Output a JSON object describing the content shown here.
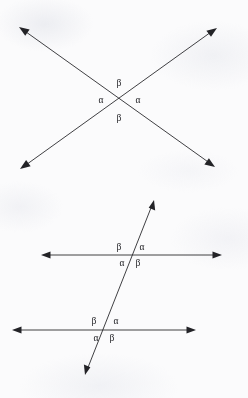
{
  "figure": {
    "title": "Angle relationships at line intersections",
    "background_color": "#fbfbfc",
    "line_color": "#2a2a2e",
    "label_color": "#1d1d21",
    "symbols": {
      "alpha": "α",
      "beta": "β"
    }
  },
  "diagrams": [
    {
      "name": "vertical-angles-x-crossing",
      "description": "Two straight lines crossing at a point forming an X, with vertical angle pairs marked",
      "intersection": {
        "x": 119,
        "y": 100
      },
      "lines": [
        {
          "name": "line-nw-se",
          "x1": 19,
          "y1": 27,
          "x2": 215,
          "y2": 167,
          "arrows": [
            "start",
            "end"
          ]
        },
        {
          "name": "line-ne-sw",
          "x1": 217,
          "y1": 28,
          "x2": 20,
          "y2": 169,
          "arrows": [
            "start",
            "end"
          ]
        }
      ],
      "labels": [
        {
          "name": "label-top-beta",
          "text": "β",
          "x": 119,
          "y": 84
        },
        {
          "name": "label-left-alpha",
          "text": "α",
          "x": 101,
          "y": 101
        },
        {
          "name": "label-right-alpha",
          "text": "α",
          "x": 138,
          "y": 101
        },
        {
          "name": "label-bottom-beta",
          "text": "β",
          "x": 119,
          "y": 119
        }
      ]
    },
    {
      "name": "transversal-two-parallel-lines",
      "description": "A transversal crossing two parallel horizontal lines, with corresponding angle pairs marked",
      "lines": [
        {
          "name": "transversal",
          "x1": 154,
          "y1": 200,
          "x2": 85,
          "y2": 375,
          "arrows": [
            "start",
            "end"
          ]
        },
        {
          "name": "parallel-line-upper",
          "x1": 41,
          "y1": 255,
          "x2": 222,
          "y2": 255,
          "arrows": [
            "start",
            "end"
          ]
        },
        {
          "name": "parallel-line-lower",
          "x1": 12,
          "y1": 330,
          "x2": 196,
          "y2": 330,
          "arrows": [
            "start",
            "end"
          ]
        }
      ],
      "intersections": [
        {
          "name": "upper-intersection",
          "x": 131,
          "y": 255
        },
        {
          "name": "lower-intersection",
          "x": 105,
          "y": 330
        }
      ],
      "labels": [
        {
          "name": "upper-above-left-beta",
          "text": "β",
          "x": 119,
          "y": 248
        },
        {
          "name": "upper-above-right-alpha",
          "text": "α",
          "x": 142,
          "y": 248
        },
        {
          "name": "upper-below-left-alpha",
          "text": "α",
          "x": 122,
          "y": 264
        },
        {
          "name": "upper-below-right-beta",
          "text": "β",
          "x": 138,
          "y": 264
        },
        {
          "name": "lower-above-left-beta",
          "text": "β",
          "x": 94,
          "y": 322
        },
        {
          "name": "lower-above-right-alpha",
          "text": "α",
          "x": 116,
          "y": 322
        },
        {
          "name": "lower-below-left-alpha",
          "text": "α",
          "x": 96,
          "y": 339
        },
        {
          "name": "lower-below-right-beta",
          "text": "β",
          "x": 112,
          "y": 339
        }
      ]
    }
  ]
}
